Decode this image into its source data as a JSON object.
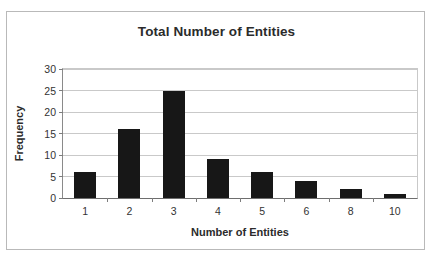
{
  "chart_data": {
    "type": "bar",
    "title": "Total Number of Entities",
    "xlabel": "Number of Entities",
    "ylabel": "Frequency",
    "categories": [
      "1",
      "2",
      "3",
      "4",
      "5",
      "6",
      "8",
      "10"
    ],
    "values": [
      6,
      16,
      25,
      9,
      6,
      4,
      2,
      1
    ],
    "series": [
      {
        "name": "Frequency",
        "values": [
          6,
          16,
          25,
          9,
          6,
          4,
          2,
          1
        ]
      }
    ],
    "ylim": [
      0,
      30
    ],
    "yticks": [
      0,
      5,
      10,
      15,
      20,
      25,
      30
    ],
    "ytick_labels": [
      "0",
      "5",
      "10",
      "15",
      "20",
      "25",
      "30"
    ],
    "grid": "horizontal",
    "legend": "none",
    "bar_color": "#171717",
    "plot_background": "#ffffff",
    "gridline_color": "#c9c9c9",
    "frame_border_color": "#b9b9b9"
  }
}
